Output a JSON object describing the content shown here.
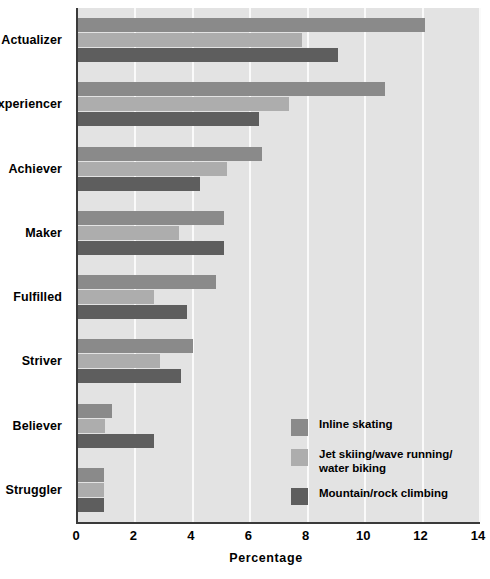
{
  "chart_data": {
    "type": "bar",
    "orientation": "horizontal",
    "title": "",
    "xlabel": "Percentage",
    "ylabel": "",
    "xlim": [
      0,
      14
    ],
    "xticks": [
      0,
      2,
      4,
      6,
      8,
      10,
      12,
      14
    ],
    "grid": true,
    "legend_position": "inside-bottom-right",
    "categories": [
      "Actualizer",
      "Experiencer",
      "Achiever",
      "Maker",
      "Fulfilled",
      "Striver",
      "Believer",
      "Struggler"
    ],
    "series": [
      {
        "name": "Inline skating",
        "color": "#8a8a8a",
        "values": [
          12.1,
          10.7,
          6.4,
          5.1,
          4.8,
          4.0,
          1.2,
          0.9
        ]
      },
      {
        "name": "Jet skiing/wave running/\nwater biking",
        "color": "#adadad",
        "values": [
          7.8,
          7.35,
          5.2,
          3.5,
          2.65,
          2.85,
          0.95,
          0.9
        ]
      },
      {
        "name": "Mountain/rock climbing",
        "color": "#5e5e5e",
        "values": [
          9.05,
          6.3,
          4.25,
          5.1,
          3.8,
          3.6,
          2.65,
          0.9
        ]
      }
    ]
  },
  "axis": {
    "x_tick_labels": [
      "0",
      "2",
      "4",
      "6",
      "8",
      "10",
      "12",
      "14"
    ],
    "x_title": "Percentage"
  },
  "legend": {
    "items": [
      {
        "label": "Inline skating",
        "color": "#8a8a8a"
      },
      {
        "label": "Jet skiing/wave running/\nwater biking",
        "color": "#adadad"
      },
      {
        "label": "Mountain/rock climbing",
        "color": "#5e5e5e"
      }
    ]
  },
  "margin_marks": {
    "top": "",
    "mid": "",
    "low": ""
  }
}
